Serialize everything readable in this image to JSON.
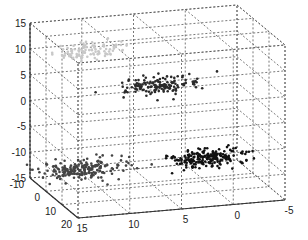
{
  "chart_data": {
    "type": "scatter3d",
    "title": "",
    "xlabel": "",
    "ylabel": "",
    "zlabel": "",
    "grid": true,
    "axes": {
      "x": {
        "ticks": [
          "15",
          "10",
          "5",
          "0",
          "-5"
        ],
        "range": [
          15,
          -5
        ]
      },
      "y": {
        "ticks": [
          "-10",
          "0",
          "10",
          "20"
        ],
        "range": [
          -10,
          20
        ]
      },
      "z": {
        "ticks": [
          "15",
          "10",
          "5",
          "0",
          "-5",
          "-10",
          "-15"
        ],
        "range": [
          -15,
          15
        ]
      }
    },
    "series": [
      {
        "name": "cluster-light-gray",
        "color": "#c8c8c8",
        "center": {
          "x": 10,
          "y": -5,
          "z": 10
        },
        "spread": 1.5,
        "approx_points": 100
      },
      {
        "name": "cluster-dark-upper",
        "color": "#2a2a2a",
        "center": {
          "x": 5,
          "y": 5,
          "z": 5
        },
        "spread": 1.5,
        "approx_points": 150
      },
      {
        "name": "cluster-dark-left",
        "color": "#444444",
        "center": {
          "x": 12,
          "y": 5,
          "z": -10
        },
        "spread": 1.8,
        "approx_points": 200
      },
      {
        "name": "cluster-dark-right",
        "color": "#111111",
        "center": {
          "x": 0,
          "y": 5,
          "z": -10
        },
        "spread": 1.5,
        "approx_points": 200
      }
    ]
  },
  "colors": {
    "axis": "#333333",
    "grid": "#555555",
    "background": "#ffffff"
  }
}
